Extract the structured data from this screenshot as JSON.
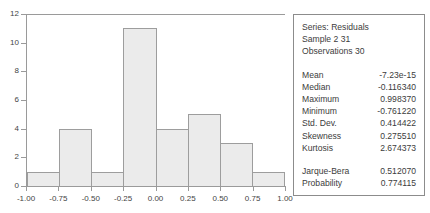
{
  "chart_data": {
    "type": "bar",
    "title": "",
    "subtitle": "",
    "xlabel": "",
    "ylabel": "",
    "grid": false,
    "legend_position": "none",
    "bin_edges": [
      -1.0,
      -0.75,
      -0.5,
      -0.25,
      0.0,
      0.25,
      0.5,
      0.75,
      1.0
    ],
    "categories": [
      "-1.00 to -0.75",
      "-0.75 to -0.50",
      "-0.50 to -0.25",
      "-0.25 to 0.00",
      "0.00 to 0.25",
      "0.25 to 0.50",
      "0.50 to 0.75",
      "0.75 to 1.00"
    ],
    "values": [
      1,
      4,
      1,
      11,
      4,
      5,
      3,
      1
    ],
    "xlim": [
      -1.0,
      1.0
    ],
    "ylim": [
      0,
      12
    ],
    "x_ticks": [
      -1.0,
      -0.75,
      -0.5,
      -0.25,
      0.0,
      0.25,
      0.5,
      0.75,
      1.0
    ],
    "x_tick_labels": [
      "-1.00",
      "-0.75",
      "-0.50",
      "-0.25",
      "0.00",
      "0.25",
      "0.50",
      "0.75",
      "1.00"
    ],
    "y_ticks": [
      0,
      2,
      4,
      6,
      8,
      10,
      12
    ],
    "y_tick_labels": [
      "0",
      "2",
      "4",
      "6",
      "8",
      "10",
      "12"
    ],
    "bar_fill_color": "#ebebeb",
    "bar_border_color": "#9d9d9d",
    "axis_color": "#9a9a9a"
  },
  "stats_panel": {
    "header_lines": [
      "Series: Residuals",
      "Sample 2 31",
      "Observations 30"
    ],
    "series_name": "Residuals",
    "sample": "2 31",
    "observations": "30",
    "rows": [
      {
        "label": "Mean",
        "value": "-7.23e-15"
      },
      {
        "label": "Median",
        "value": "-0.116340"
      },
      {
        "label": "Maximum",
        "value": "0.998370"
      },
      {
        "label": "Minimum",
        "value": "-0.761220"
      },
      {
        "label": "Std. Dev.",
        "value": "0.414422"
      },
      {
        "label": "Skewness",
        "value": "0.275510"
      },
      {
        "label": "Kurtosis",
        "value": "2.674373"
      }
    ],
    "test_rows": [
      {
        "label": "Jarque-Bera",
        "value": "0.512070"
      },
      {
        "label": "Probability",
        "value": "0.774115"
      }
    ],
    "border_color": "#8c8c8c",
    "text_color": "#3c3c3c"
  }
}
